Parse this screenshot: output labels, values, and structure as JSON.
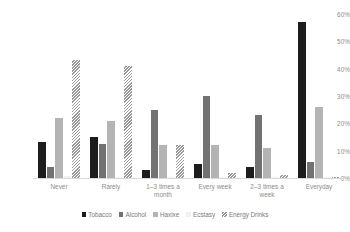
{
  "chart_data": {
    "type": "bar",
    "title": "",
    "subtitle": "",
    "xlabel": "",
    "ylabel": "",
    "ylim": [
      0,
      60
    ],
    "ytick_labels": [
      "60%",
      "50%",
      "40%",
      "30%",
      "20%",
      "10%",
      "0%"
    ],
    "ytick_values": [
      60,
      50,
      40,
      30,
      20,
      10,
      0
    ],
    "grid": false,
    "legend_position": "bottom",
    "categories": [
      "Never",
      "Rarely",
      "1–3 times a month",
      "Every week",
      "2–3 times a week",
      "Everyday"
    ],
    "series": [
      {
        "name": "Tobacco",
        "color": "#1c1c1c",
        "values": [
          13,
          15,
          3,
          5,
          4,
          57
        ]
      },
      {
        "name": "Alcohol",
        "color": "#727272",
        "values": [
          4,
          12.5,
          25,
          30,
          23,
          6
        ]
      },
      {
        "name": "Haxixe",
        "color": "#b4b4b4",
        "values": [
          22,
          21,
          12,
          12,
          11,
          26
        ]
      },
      {
        "name": "Ecstasy",
        "color": "#f2f2f2",
        "values": [
          0.6,
          0.5,
          0.4,
          0.3,
          0.3,
          0.3
        ]
      },
      {
        "name": "Energy Drinks",
        "color": "#ffffff",
        "pattern": "diagonal-hatch",
        "values": [
          43,
          41,
          12,
          2,
          1,
          0.5
        ]
      }
    ]
  }
}
